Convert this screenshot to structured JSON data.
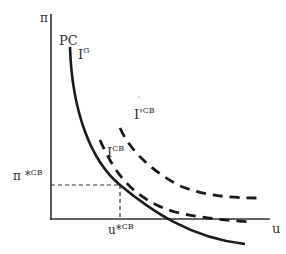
{
  "diagram": {
    "y_axis_label": "π",
    "x_axis_label": "u",
    "curves": {
      "pc": {
        "label": "PC",
        "style": "solid"
      },
      "ig": {
        "label": "I",
        "sup": "G",
        "style": "solid"
      },
      "icb_upper": {
        "label": "I'",
        "sup": "CB",
        "style": "dashed"
      },
      "icb_lower": {
        "label": "I",
        "sup": "CB",
        "style": "dashed"
      }
    },
    "equilibrium": {
      "pi_label": "π *",
      "pi_sup": "CB",
      "u_label": "u*",
      "u_sup": "CB"
    },
    "colors": {
      "line": "#1a1a1a",
      "axis": "#333333",
      "dash": "#1a1a1a"
    }
  }
}
